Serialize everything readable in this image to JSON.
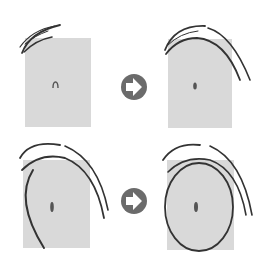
{
  "diagram": {
    "title": "",
    "colors": {
      "background": "#ffffff",
      "panel": "#d9d9d9",
      "stroke": "#3a3a3a",
      "arrow_circle": "#6b6b6b",
      "arrow_glyph": "#ffffff"
    },
    "panels": [
      {
        "id": "step-1",
        "row": 1,
        "col": 1
      },
      {
        "id": "step-2",
        "row": 1,
        "col": 2
      },
      {
        "id": "step-3",
        "row": 2,
        "col": 1
      },
      {
        "id": "step-4",
        "row": 2,
        "col": 2
      }
    ],
    "arrows": [
      {
        "id": "arrow-1",
        "icon": "right-arrow-icon"
      },
      {
        "id": "arrow-2",
        "icon": "right-arrow-icon"
      }
    ]
  }
}
